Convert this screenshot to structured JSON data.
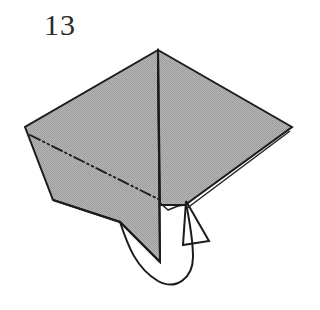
{
  "figure": {
    "step_number": "13",
    "kind": "origami-fold-diagram",
    "background_color": "#ffffff",
    "paper_fill_color": "#a9a9a9",
    "paper_fill_color_light": "#b4b4b4",
    "line_color": "#1c1c1c",
    "crease_color": "#1c1c1c",
    "arrow_color": "#1c1c1c"
  },
  "geometry": {
    "apex": [
      158,
      50
    ],
    "left_vertex": [
      25,
      127
    ],
    "right_vertex": [
      292,
      127
    ],
    "left_lower_corner": [
      53,
      200
    ],
    "bottom_flap_tip": [
      160,
      262
    ],
    "center_fold_line": [
      [
        158,
        50
      ],
      [
        160,
        262
      ]
    ],
    "crease_dash_dot": [
      [
        30,
        135
      ],
      [
        160,
        200
      ]
    ],
    "lower_right_edge": [
      [
        292,
        127
      ],
      [
        185,
        205
      ]
    ],
    "bottom_edge_left": [
      [
        53,
        200
      ],
      [
        120,
        222
      ]
    ],
    "arrow_tail_start": [
      120,
      222
    ],
    "arrow_head_tip": [
      186,
      201
    ]
  },
  "annotations": {
    "crease_line_label": "mountain-valley crease (dash-dot-dot)",
    "arrow_label": "fold-under arrow",
    "center_fold_label": "center vertical fold",
    "paper_label": "folded paper body"
  }
}
